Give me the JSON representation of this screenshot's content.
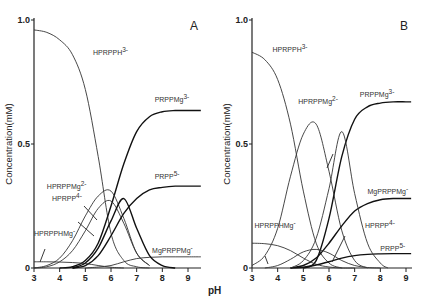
{
  "chart_data": [
    {
      "type": "line",
      "panel": "A",
      "xlabel": "pH",
      "ylabel": "Concentration(mM)",
      "xlim": [
        3,
        9.5
      ],
      "ylim": [
        0,
        1.0
      ],
      "xticks": [
        "3",
        "4",
        "5",
        "6",
        "7",
        "8",
        "9"
      ],
      "yticks": [
        "0",
        "0.5",
        "1.0"
      ],
      "series": [
        {
          "name": "HPRPPH3-",
          "bold": false,
          "x": [
            3,
            3.5,
            4,
            4.5,
            5,
            5.5,
            6,
            6.5,
            7,
            7.5
          ],
          "y": [
            0.96,
            0.95,
            0.92,
            0.86,
            0.72,
            0.45,
            0.14,
            0.03,
            0.005,
            0
          ]
        },
        {
          "name": "PRPPMg3-",
          "bold": true,
          "x": [
            4,
            4.5,
            5,
            5.5,
            6,
            6.5,
            7,
            7.5,
            8,
            8.5,
            9,
            9.5
          ],
          "y": [
            0,
            0.005,
            0.03,
            0.1,
            0.25,
            0.42,
            0.55,
            0.61,
            0.63,
            0.635,
            0.635,
            0.635
          ]
        },
        {
          "name": "HPRPPMg2-",
          "bold": false,
          "x": [
            3,
            3.5,
            4,
            4.5,
            5,
            5.5,
            6,
            6.5,
            7,
            7.5
          ],
          "y": [
            0,
            0.01,
            0.04,
            0.11,
            0.21,
            0.29,
            0.31,
            0.2,
            0.06,
            0.01
          ]
        },
        {
          "name": "HPRPP4-",
          "bold": false,
          "x": [
            3,
            3.5,
            4,
            4.5,
            5,
            5.5,
            6,
            6.5,
            7,
            7.5
          ],
          "y": [
            0,
            0.005,
            0.025,
            0.07,
            0.15,
            0.24,
            0.27,
            0.18,
            0.06,
            0.01
          ]
        },
        {
          "name": "PRPP5-",
          "bold": true,
          "x": [
            4.5,
            5,
            5.5,
            6,
            6.5,
            7,
            7.5,
            8,
            8.5,
            9,
            9.5
          ],
          "y": [
            0,
            0.01,
            0.05,
            0.13,
            0.22,
            0.28,
            0.315,
            0.325,
            0.33,
            0.33,
            0.33
          ]
        },
        {
          "name": "HPRPPHMg-",
          "bold": false,
          "x": [
            3,
            3.5,
            4,
            4.5,
            5,
            5.5,
            6,
            6.5
          ],
          "y": [
            0.025,
            0.025,
            0.024,
            0.022,
            0.018,
            0.01,
            0.003,
            0
          ]
        },
        {
          "name": "MgPRPPMg-",
          "bold": false,
          "x": [
            5,
            5.5,
            6,
            6.5,
            7,
            7.5,
            8,
            8.5,
            9,
            9.5
          ],
          "y": [
            0,
            0.004,
            0.01,
            0.025,
            0.038,
            0.043,
            0.045,
            0.045,
            0.045,
            0.045
          ]
        },
        {
          "name": "PRPPH-peak",
          "bold": true,
          "x": [
            4.5,
            5,
            5.5,
            6,
            6.5,
            7,
            7.5,
            8,
            8.5
          ],
          "y": [
            0,
            0.02,
            0.08,
            0.19,
            0.28,
            0.16,
            0.05,
            0.01,
            0
          ]
        }
      ],
      "labels": [
        {
          "text": "HPRPPH",
          "sup": "3-",
          "x": 5.3,
          "y": 0.86
        },
        {
          "text": "PRPPMg",
          "sup": "3-",
          "x": 7.7,
          "y": 0.67
        },
        {
          "text": "PRPP",
          "sup": "5-",
          "x": 7.7,
          "y": 0.36
        },
        {
          "text": "HPRPPMg",
          "sup": "2-",
          "x": 3.5,
          "y": 0.32
        },
        {
          "text": "HPRPP",
          "sup": "4-",
          "x": 3.7,
          "y": 0.27
        },
        {
          "text": "HPRPPHMg",
          "sup": "-",
          "x": 3.0,
          "y": 0.13
        },
        {
          "text": "MgPRPPMg",
          "sup": "-",
          "x": 7.6,
          "y": 0.06
        }
      ]
    },
    {
      "type": "line",
      "panel": "B",
      "xlabel": "pH",
      "ylabel": "Concentration(mM)",
      "xlim": [
        3,
        9.2
      ],
      "ylim": [
        0,
        1.0
      ],
      "xticks": [
        "3",
        "4",
        "5",
        "6",
        "7",
        "8",
        "9"
      ],
      "yticks": [
        "0",
        "0.5",
        "1.0"
      ],
      "series": [
        {
          "name": "HPRPPH3-",
          "bold": false,
          "x": [
            3,
            3.5,
            4,
            4.5,
            5,
            5.5,
            6,
            6.5
          ],
          "y": [
            0.87,
            0.84,
            0.76,
            0.58,
            0.31,
            0.1,
            0.02,
            0
          ]
        },
        {
          "name": "PRPPMg3-",
          "bold": true,
          "x": [
            5,
            5.5,
            6,
            6.5,
            7,
            7.5,
            8,
            8.5,
            9,
            9.2
          ],
          "y": [
            0,
            0.03,
            0.2,
            0.45,
            0.6,
            0.65,
            0.665,
            0.67,
            0.67,
            0.67
          ]
        },
        {
          "name": "HPRPPMg2-",
          "bold": false,
          "x": [
            3,
            3.5,
            4,
            4.5,
            5,
            5.5,
            6,
            6.5,
            7,
            7.5
          ],
          "y": [
            0.01,
            0.05,
            0.16,
            0.37,
            0.54,
            0.58,
            0.39,
            0.15,
            0.03,
            0
          ]
        },
        {
          "name": "MgPRPPMg-",
          "bold": true,
          "x": [
            4.5,
            5,
            5.5,
            6,
            6.5,
            7,
            7.5,
            8,
            8.5,
            9,
            9.2
          ],
          "y": [
            0,
            0.01,
            0.04,
            0.1,
            0.17,
            0.23,
            0.26,
            0.275,
            0.28,
            0.28,
            0.28
          ]
        },
        {
          "name": "HPRPPHMg-",
          "bold": false,
          "x": [
            3,
            3.5,
            4,
            4.5,
            5,
            5.5,
            6,
            6.5,
            7
          ],
          "y": [
            0.1,
            0.098,
            0.09,
            0.07,
            0.04,
            0.015,
            0.004,
            0,
            0
          ]
        },
        {
          "name": "HPRPP4-",
          "bold": false,
          "x": [
            3.5,
            4,
            4.5,
            5,
            5.5,
            6,
            6.5,
            7,
            7.5,
            8
          ],
          "y": [
            0,
            0.01,
            0.035,
            0.065,
            0.075,
            0.06,
            0.03,
            0.01,
            0.002,
            0
          ]
        },
        {
          "name": "PRPP5-",
          "bold": true,
          "x": [
            4.5,
            5,
            5.5,
            6,
            6.5,
            7,
            7.5,
            8,
            8.5,
            9,
            9.2
          ],
          "y": [
            0,
            0.003,
            0.012,
            0.025,
            0.04,
            0.05,
            0.055,
            0.057,
            0.058,
            0.058,
            0.058
          ]
        },
        {
          "name": "peak-6.5",
          "bold": false,
          "x": [
            4.5,
            5,
            5.5,
            6,
            6.5,
            7,
            7.5,
            8,
            8.3
          ],
          "y": [
            0,
            0.03,
            0.12,
            0.32,
            0.55,
            0.3,
            0.1,
            0.02,
            0
          ]
        }
      ],
      "labels": [
        {
          "text": "HPRPPH",
          "sup": "3-",
          "x": 3.8,
          "y": 0.87
        },
        {
          "text": "HPRPPMg",
          "sup": "2-",
          "x": 4.8,
          "y": 0.66
        },
        {
          "text": "PRPPMg",
          "sup": "3-",
          "x": 7.2,
          "y": 0.69
        },
        {
          "text": "MgPRPPMg",
          "sup": "-",
          "x": 7.5,
          "y": 0.3
        },
        {
          "text": "HPRPPHMg",
          "sup": "-",
          "x": 3.1,
          "y": 0.16
        },
        {
          "text": "HPRPP",
          "sup": "4-",
          "x": 7.4,
          "y": 0.16
        },
        {
          "text": "PRPP",
          "sup": "5-",
          "x": 8.0,
          "y": 0.07
        }
      ]
    }
  ]
}
